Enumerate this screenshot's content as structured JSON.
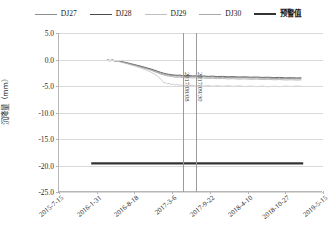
{
  "legend": {
    "items": [
      {
        "label": "DJ27",
        "color": "#8c8c8c",
        "width": 1.1
      },
      {
        "label": "DJ28",
        "color": "#4a4a4a",
        "width": 1.1
      },
      {
        "label": "DJ29",
        "color": "#c0c0c0",
        "width": 1.1
      },
      {
        "label": "DJ30",
        "color": "#a8a8a8",
        "width": 1.1
      },
      {
        "label": "预警值",
        "color": "#333333",
        "width": 2.6
      }
    ]
  },
  "chart_data": {
    "type": "line",
    "title": "",
    "xlabel": "",
    "ylabel": "沉降量（mm）",
    "ylim": [
      -25.0,
      5.0
    ],
    "ytick_labels": [
      "5.0",
      "0.0",
      "-5.0",
      "-10.0",
      "-15.0",
      "-20.0",
      "-25.0"
    ],
    "ytick_values": [
      5.0,
      0.0,
      -5.0,
      -10.0,
      -15.0,
      -20.0,
      -25.0
    ],
    "xtick_labels": [
      "2015-7-15",
      "2016-1-31",
      "2016-8-18",
      "2017-3-6",
      "2017-9-22",
      "2018-4-10",
      "2018-10-27",
      "2019-5-15"
    ],
    "grid": true,
    "legend_position": "top",
    "annotations": [
      {
        "type": "vline",
        "label": "2017/08/08",
        "x_frac": 0.468
      },
      {
        "type": "vline",
        "label": "2017/09/30",
        "x_frac": 0.518
      }
    ],
    "warning_line": {
      "name": "预警值",
      "value": -19.6,
      "x_start_frac": 0.122,
      "x_end_frac": 0.925,
      "color": "#333333"
    },
    "series": [
      {
        "name": "DJ27",
        "color": "#8c8c8c",
        "points": [
          [
            0.182,
            -0.1
          ],
          [
            0.192,
            -0.22
          ],
          [
            0.203,
            -0.14
          ],
          [
            0.214,
            -0.3
          ],
          [
            0.225,
            -0.28
          ],
          [
            0.236,
            -0.45
          ],
          [
            0.248,
            -0.58
          ],
          [
            0.26,
            -0.72
          ],
          [
            0.272,
            -0.88
          ],
          [
            0.285,
            -1.02
          ],
          [
            0.297,
            -1.2
          ],
          [
            0.31,
            -1.38
          ],
          [
            0.322,
            -1.55
          ],
          [
            0.335,
            -1.74
          ],
          [
            0.348,
            -1.92
          ],
          [
            0.36,
            -2.14
          ],
          [
            0.372,
            -2.36
          ],
          [
            0.384,
            -2.58
          ],
          [
            0.395,
            -2.74
          ],
          [
            0.405,
            -2.86
          ],
          [
            0.415,
            -2.95
          ],
          [
            0.425,
            -3.02
          ],
          [
            0.436,
            -3.08
          ],
          [
            0.447,
            -3.14
          ],
          [
            0.458,
            -3.12
          ],
          [
            0.468,
            -3.18
          ],
          [
            0.48,
            -3.22
          ],
          [
            0.492,
            -3.18
          ],
          [
            0.505,
            -3.26
          ],
          [
            0.518,
            -3.24
          ],
          [
            0.532,
            -3.3
          ],
          [
            0.548,
            -3.28
          ],
          [
            0.565,
            -3.34
          ],
          [
            0.582,
            -3.32
          ],
          [
            0.6,
            -3.38
          ],
          [
            0.62,
            -3.36
          ],
          [
            0.64,
            -3.42
          ],
          [
            0.66,
            -3.4
          ],
          [
            0.682,
            -3.46
          ],
          [
            0.704,
            -3.44
          ],
          [
            0.726,
            -3.5
          ],
          [
            0.748,
            -3.48
          ],
          [
            0.77,
            -3.54
          ],
          [
            0.792,
            -3.52
          ],
          [
            0.814,
            -3.58
          ],
          [
            0.836,
            -3.56
          ],
          [
            0.858,
            -3.62
          ],
          [
            0.88,
            -3.6
          ],
          [
            0.9,
            -3.64
          ],
          [
            0.918,
            -3.62
          ]
        ]
      },
      {
        "name": "DJ28",
        "color": "#4a4a4a",
        "points": [
          [
            0.182,
            -0.05
          ],
          [
            0.192,
            -0.18
          ],
          [
            0.203,
            -0.1
          ],
          [
            0.214,
            -0.26
          ],
          [
            0.225,
            -0.22
          ],
          [
            0.236,
            -0.38
          ],
          [
            0.248,
            -0.5
          ],
          [
            0.26,
            -0.64
          ],
          [
            0.272,
            -0.8
          ],
          [
            0.285,
            -0.94
          ],
          [
            0.297,
            -1.1
          ],
          [
            0.31,
            -1.26
          ],
          [
            0.322,
            -1.42
          ],
          [
            0.335,
            -1.6
          ],
          [
            0.348,
            -1.78
          ],
          [
            0.36,
            -1.98
          ],
          [
            0.372,
            -2.18
          ],
          [
            0.384,
            -2.4
          ],
          [
            0.395,
            -2.56
          ],
          [
            0.405,
            -2.68
          ],
          [
            0.415,
            -2.78
          ],
          [
            0.425,
            -2.86
          ],
          [
            0.436,
            -2.92
          ],
          [
            0.447,
            -2.98
          ],
          [
            0.458,
            -2.94
          ],
          [
            0.468,
            -3.02
          ],
          [
            0.48,
            -3.06
          ],
          [
            0.492,
            -3.0
          ],
          [
            0.505,
            -3.1
          ],
          [
            0.518,
            -3.06
          ],
          [
            0.532,
            -3.14
          ],
          [
            0.548,
            -3.1
          ],
          [
            0.565,
            -3.18
          ],
          [
            0.582,
            -3.14
          ],
          [
            0.6,
            -3.22
          ],
          [
            0.62,
            -3.18
          ],
          [
            0.64,
            -3.26
          ],
          [
            0.66,
            -3.22
          ],
          [
            0.682,
            -3.3
          ],
          [
            0.704,
            -3.26
          ],
          [
            0.726,
            -3.34
          ],
          [
            0.748,
            -3.3
          ],
          [
            0.77,
            -3.38
          ],
          [
            0.792,
            -3.34
          ],
          [
            0.814,
            -3.42
          ],
          [
            0.836,
            -3.38
          ],
          [
            0.858,
            -3.46
          ],
          [
            0.88,
            -3.42
          ],
          [
            0.9,
            -3.48
          ],
          [
            0.918,
            -3.44
          ]
        ]
      },
      {
        "name": "DJ29",
        "color": "#c0c0c0",
        "points": [
          [
            0.182,
            -0.12
          ],
          [
            0.192,
            -0.28
          ],
          [
            0.203,
            -0.2
          ],
          [
            0.214,
            -0.36
          ],
          [
            0.225,
            -0.34
          ],
          [
            0.236,
            -0.52
          ],
          [
            0.248,
            -0.68
          ],
          [
            0.26,
            -0.84
          ],
          [
            0.272,
            -1.02
          ],
          [
            0.285,
            -1.2
          ],
          [
            0.297,
            -1.4
          ],
          [
            0.31,
            -1.62
          ],
          [
            0.322,
            -1.84
          ],
          [
            0.335,
            -2.1
          ],
          [
            0.348,
            -2.38
          ],
          [
            0.36,
            -2.7
          ],
          [
            0.372,
            -3.1
          ],
          [
            0.384,
            -3.6
          ],
          [
            0.392,
            -4.1
          ],
          [
            0.398,
            -4.45
          ],
          [
            0.404,
            -4.3
          ],
          [
            0.41,
            -4.62
          ],
          [
            0.417,
            -4.48
          ],
          [
            0.424,
            -4.74
          ],
          [
            0.431,
            -4.6
          ],
          [
            0.438,
            -4.82
          ],
          [
            0.446,
            -4.7
          ],
          [
            0.454,
            -4.88
          ],
          [
            0.462,
            -4.76
          ],
          [
            0.47,
            -4.92
          ],
          [
            0.48,
            -4.82
          ],
          [
            0.492,
            -4.96
          ],
          [
            0.505,
            -4.86
          ],
          [
            0.518,
            -5.0
          ],
          [
            0.532,
            -4.9
          ],
          [
            0.548,
            -5.02
          ],
          [
            0.565,
            -4.92
          ],
          [
            0.582,
            -5.04
          ],
          [
            0.6,
            -4.94
          ],
          [
            0.62,
            -5.06
          ],
          [
            0.64,
            -4.96
          ],
          [
            0.66,
            -5.08
          ],
          [
            0.682,
            -4.98
          ],
          [
            0.704,
            -5.1
          ],
          [
            0.726,
            -5.0
          ],
          [
            0.748,
            -5.12
          ],
          [
            0.77,
            -5.02
          ],
          [
            0.792,
            -5.14
          ],
          [
            0.814,
            -5.04
          ],
          [
            0.836,
            -5.12
          ],
          [
            0.858,
            -5.02
          ],
          [
            0.88,
            -5.1
          ],
          [
            0.9,
            -5.0
          ],
          [
            0.918,
            -5.06
          ]
        ]
      },
      {
        "name": "DJ30",
        "color": "#a8a8a8",
        "points": [
          [
            0.182,
            -0.08
          ],
          [
            0.192,
            -0.24
          ],
          [
            0.203,
            -0.16
          ],
          [
            0.214,
            -0.32
          ],
          [
            0.225,
            -0.3
          ],
          [
            0.236,
            -0.46
          ],
          [
            0.248,
            -0.6
          ],
          [
            0.26,
            -0.76
          ],
          [
            0.272,
            -0.92
          ],
          [
            0.285,
            -1.08
          ],
          [
            0.297,
            -1.26
          ],
          [
            0.31,
            -1.44
          ],
          [
            0.322,
            -1.62
          ],
          [
            0.335,
            -1.82
          ],
          [
            0.348,
            -2.02
          ],
          [
            0.36,
            -2.26
          ],
          [
            0.372,
            -2.5
          ],
          [
            0.384,
            -2.74
          ],
          [
            0.395,
            -2.9
          ],
          [
            0.405,
            -3.04
          ],
          [
            0.415,
            -3.14
          ],
          [
            0.425,
            -3.22
          ],
          [
            0.436,
            -3.3
          ],
          [
            0.447,
            -3.36
          ],
          [
            0.458,
            -3.32
          ],
          [
            0.468,
            -3.42
          ],
          [
            0.48,
            -3.46
          ],
          [
            0.492,
            -3.4
          ],
          [
            0.505,
            -3.5
          ],
          [
            0.518,
            -3.46
          ],
          [
            0.532,
            -3.54
          ],
          [
            0.548,
            -3.5
          ],
          [
            0.565,
            -3.58
          ],
          [
            0.582,
            -3.54
          ],
          [
            0.6,
            -3.62
          ],
          [
            0.62,
            -3.58
          ],
          [
            0.64,
            -3.66
          ],
          [
            0.66,
            -3.62
          ],
          [
            0.682,
            -3.7
          ],
          [
            0.704,
            -3.66
          ],
          [
            0.726,
            -3.74
          ],
          [
            0.748,
            -3.7
          ],
          [
            0.77,
            -3.78
          ],
          [
            0.792,
            -3.74
          ],
          [
            0.814,
            -3.82
          ],
          [
            0.836,
            -3.78
          ],
          [
            0.858,
            -3.86
          ],
          [
            0.88,
            -3.82
          ],
          [
            0.9,
            -3.88
          ],
          [
            0.918,
            -3.84
          ]
        ]
      }
    ]
  }
}
